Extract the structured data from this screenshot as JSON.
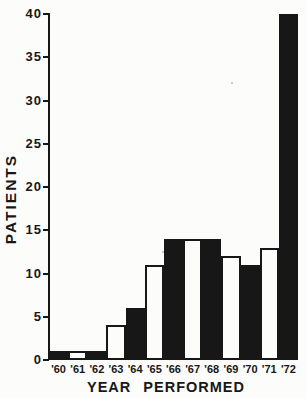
{
  "figure": {
    "background": "#fcfcfb",
    "ink": "#171717"
  },
  "chart_data": {
    "type": "bar",
    "title": "",
    "xlabel": "YEAR PERFORMED",
    "ylabel": "PATIENTS",
    "categories": [
      "'60",
      "'61",
      "'62",
      "'63",
      "'64",
      "'65",
      "'66",
      "'67",
      "'68",
      "'69",
      "'70",
      "'71",
      "'72"
    ],
    "values": [
      1,
      1,
      1,
      4,
      6,
      11,
      14,
      14,
      14,
      12,
      11,
      13,
      40
    ],
    "bar_fills": [
      "black",
      "white",
      "black",
      "white",
      "black",
      "white",
      "black",
      "white",
      "black",
      "white",
      "black",
      "white",
      "black"
    ],
    "ylim": [
      0,
      40
    ],
    "yticks": [
      0,
      5,
      10,
      15,
      20,
      25,
      30,
      35,
      40
    ],
    "grid": false,
    "bars_contiguous": true,
    "legend": "none"
  }
}
